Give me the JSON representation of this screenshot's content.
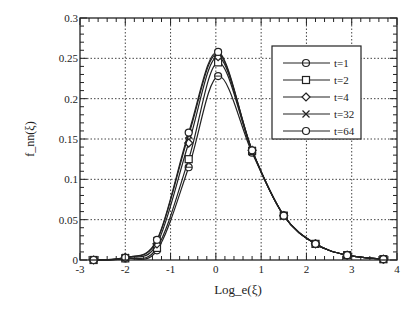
{
  "chart_data": {
    "type": "line",
    "title": "",
    "xlabel": "Log_e(ξ)",
    "ylabel": "f_nn(ξ)",
    "xlim": [
      -3,
      4
    ],
    "ylim": [
      0,
      0.3
    ],
    "xticks": [
      "-3",
      "-2",
      "-1",
      "0",
      "1",
      "2",
      "3",
      "4"
    ],
    "yticks": [
      "0",
      "0.05",
      "0.1",
      "0.15",
      "0.2",
      "0.25",
      "0.3"
    ],
    "grid": true,
    "legend_position": "upper right",
    "x": [
      -2.7,
      -2.0,
      -1.3,
      -0.6,
      0.05,
      0.8,
      1.5,
      2.2,
      2.9,
      3.7
    ],
    "series": [
      {
        "name": "t=1",
        "marker": "circle-bar",
        "values": [
          0.0,
          0.002,
          0.012,
          0.115,
          0.228,
          0.133,
          0.055,
          0.02,
          0.006,
          0.001
        ]
      },
      {
        "name": "t=2",
        "marker": "square",
        "values": [
          0.0,
          0.002,
          0.015,
          0.125,
          0.245,
          0.135,
          0.055,
          0.02,
          0.006,
          0.001
        ]
      },
      {
        "name": "t=4",
        "marker": "diamond",
        "values": [
          0.0,
          0.003,
          0.02,
          0.145,
          0.252,
          0.136,
          0.055,
          0.02,
          0.006,
          0.001
        ]
      },
      {
        "name": "t=32",
        "marker": "x",
        "values": [
          0.0,
          0.003,
          0.024,
          0.155,
          0.256,
          0.136,
          0.055,
          0.02,
          0.006,
          0.001
        ]
      },
      {
        "name": "t=64",
        "marker": "circle",
        "values": [
          0.0,
          0.003,
          0.025,
          0.158,
          0.258,
          0.136,
          0.055,
          0.02,
          0.006,
          0.001
        ]
      }
    ]
  }
}
